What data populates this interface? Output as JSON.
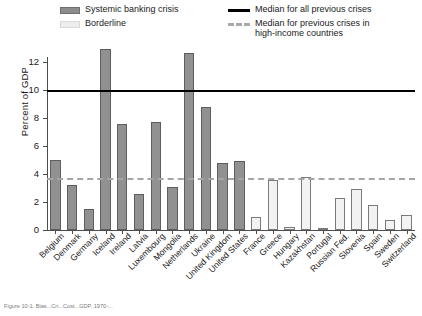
{
  "legend": {
    "systemic_label": "Systemic banking crisis",
    "borderline_label": "Borderline",
    "median_all_label": "Median for all previous crises",
    "median_high_income_label": "Median for previous crises in\nhigh-income countries",
    "colors": {
      "systemic_fill": "#919191",
      "borderline_fill": "#f2f2f2",
      "median_all": "#000000",
      "median_high_income": "#a6a6a6"
    }
  },
  "axes": {
    "ylabel": "Percent of GDP",
    "yticks": [
      0,
      2,
      4,
      6,
      8,
      10,
      12
    ],
    "ylim": [
      0,
      13.2
    ]
  },
  "caption": "Figure 10-1.  Bias...Cri...Cost...GDP, 1970-...",
  "chart_data": {
    "type": "bar",
    "title": "",
    "xlabel": "",
    "ylabel": "Percent of GDP",
    "ylim": [
      0,
      13.2
    ],
    "grid": false,
    "legend_position": "top",
    "categories": [
      "Belgium",
      "Denmark",
      "Germany",
      "Iceland",
      "Ireland",
      "Latvia",
      "Luxembourg",
      "Mongolia",
      "Netherlands",
      "Ukraine",
      "United Kingdom",
      "United States",
      "France",
      "Greece",
      "Hungary",
      "Kazakhstan",
      "Portugal",
      "Russian Fed.",
      "Slovenia",
      "Spain",
      "Sweden",
      "Switzerland"
    ],
    "values": [
      5.0,
      3.2,
      1.5,
      12.9,
      7.6,
      2.6,
      7.7,
      3.1,
      12.6,
      8.8,
      4.8,
      4.9,
      0.9,
      3.6,
      0.2,
      3.8,
      0.0,
      2.3,
      2.9,
      1.8,
      0.7,
      1.1
    ],
    "series_group": [
      "systemic",
      "systemic",
      "systemic",
      "systemic",
      "systemic",
      "systemic",
      "systemic",
      "systemic",
      "systemic",
      "systemic",
      "systemic",
      "systemic",
      "borderline",
      "borderline",
      "borderline",
      "borderline",
      "borderline",
      "borderline",
      "borderline",
      "borderline",
      "borderline",
      "borderline"
    ],
    "reference_lines": [
      {
        "name": "Median for all previous crises",
        "value": 10.0,
        "style": "solid",
        "color": "#000000"
      },
      {
        "name": "Median for previous crises in high-income countries",
        "value": 3.7,
        "style": "dashed",
        "color": "#a6a6a6"
      }
    ]
  }
}
